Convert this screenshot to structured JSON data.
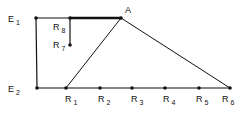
{
  "diagram": {
    "stroke_color": "#111111",
    "background": "#ffffff",
    "nodes": [
      {
        "id": "E1",
        "base": "E",
        "sub": "1",
        "x": 36,
        "y": 18,
        "lx": 8,
        "ly": 22
      },
      {
        "id": "E2",
        "base": "E",
        "sub": "2",
        "x": 37,
        "y": 88,
        "lx": 8,
        "ly": 92
      },
      {
        "id": "A",
        "base": "A",
        "sub": "",
        "x": 121,
        "y": 18,
        "lx": 125,
        "ly": 13
      },
      {
        "id": "R8",
        "base": "R",
        "sub": "8",
        "x": 70,
        "y": 18,
        "lx": 53,
        "ly": 30
      },
      {
        "id": "R7",
        "base": "R",
        "sub": "7",
        "x": 70,
        "y": 45,
        "lx": 53,
        "ly": 48
      },
      {
        "id": "R1",
        "base": "R",
        "sub": "1",
        "x": 66,
        "y": 88,
        "lx": 65,
        "ly": 102
      },
      {
        "id": "R2",
        "base": "R",
        "sub": "2",
        "x": 100,
        "y": 88,
        "lx": 98,
        "ly": 102
      },
      {
        "id": "R3",
        "base": "R",
        "sub": "3",
        "x": 132,
        "y": 88,
        "lx": 131,
        "ly": 102
      },
      {
        "id": "R4",
        "base": "R",
        "sub": "4",
        "x": 165,
        "y": 88,
        "lx": 163,
        "ly": 102
      },
      {
        "id": "R5",
        "base": "R",
        "sub": "5",
        "x": 199,
        "y": 88,
        "lx": 196,
        "ly": 102
      },
      {
        "id": "R6",
        "base": "R",
        "sub": "6",
        "x": 230,
        "y": 88,
        "lx": 222,
        "ly": 102
      }
    ],
    "edges": [
      {
        "from": "E1",
        "to": "A",
        "width": 1.2
      },
      {
        "from": "R8",
        "to": "A",
        "width": 2.5
      },
      {
        "from": "E1",
        "to": "E2",
        "width": 1.2
      },
      {
        "from": "E2",
        "to": "R6",
        "width": 1.2
      },
      {
        "from": "R8",
        "to": "R7",
        "width": 1.2
      },
      {
        "from": "R1",
        "to": "A",
        "width": 1
      },
      {
        "from": "A",
        "to": "R6",
        "width": 1
      }
    ]
  }
}
